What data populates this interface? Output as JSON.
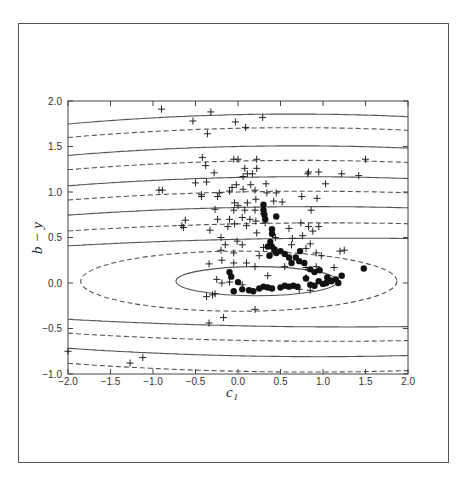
{
  "chart_data": {
    "type": "scatter",
    "title": "",
    "xlabel": "c₁",
    "ylabel": "b − y",
    "xlim": [
      -2.0,
      2.0
    ],
    "ylim": [
      -1.0,
      2.0
    ],
    "xticks": [
      -2.0,
      -1.5,
      -1.0,
      -0.5,
      0.0,
      0.5,
      1.0,
      1.5,
      2.0
    ],
    "xtick_labels": [
      "−2.0",
      "−1.5",
      "−1.0",
      "−0.5",
      "0.0",
      "0.5",
      "1.0",
      "1.5",
      "2.0"
    ],
    "yticks": [
      -1.0,
      -0.5,
      0.0,
      0.5,
      1.0,
      1.5,
      2.0
    ],
    "ytick_labels": [
      "−1.0",
      "−0.5",
      "0.0",
      "0.5",
      "1.0",
      "1.5",
      "2.0"
    ],
    "grid": false,
    "legend": null,
    "contours": {
      "description": "Concentric elliptical contours centered near (0, 0), alternating solid and dashed lines",
      "center": [
        0.0,
        0.0
      ],
      "solid_levels_at_x0": [
        0.17,
        -0.12,
        0.48,
        -0.47,
        0.83,
        -0.8,
        1.16,
        1.5,
        1.85
      ],
      "dashed_levels_at_x0": [
        0.35,
        -0.31,
        0.65,
        -0.63,
        1.0,
        -0.97,
        1.34,
        1.7
      ]
    },
    "series": [
      {
        "name": "plus markers",
        "marker": "+",
        "points": [
          [
            -0.9,
            1.91
          ],
          [
            -0.32,
            1.88
          ],
          [
            -0.53,
            1.78
          ],
          [
            -0.03,
            1.77
          ],
          [
            0.29,
            1.82
          ],
          [
            0.09,
            1.71
          ],
          [
            -0.36,
            1.64
          ],
          [
            -0.42,
            1.38
          ],
          [
            -0.05,
            1.36
          ],
          [
            0.0,
            1.36
          ],
          [
            0.22,
            1.36
          ],
          [
            -0.38,
            1.29
          ],
          [
            0.08,
            1.26
          ],
          [
            -0.28,
            1.21
          ],
          [
            0.22,
            1.26
          ],
          [
            0.17,
            1.2
          ],
          [
            0.11,
            1.2
          ],
          [
            -0.5,
            1.1
          ],
          [
            -0.37,
            1.11
          ],
          [
            0.06,
            1.17
          ],
          [
            0.33,
            1.09
          ],
          [
            -0.02,
            1.08
          ],
          [
            0.15,
            1.08
          ],
          [
            -0.93,
            1.02
          ],
          [
            -0.89,
            1.02
          ],
          [
            -0.43,
            0.95
          ],
          [
            -0.43,
            0.97
          ],
          [
            -0.22,
            0.99
          ],
          [
            -0.24,
            0.95
          ],
          [
            -0.1,
            1.01
          ],
          [
            -0.07,
            1.05
          ],
          [
            0.06,
            1.03
          ],
          [
            0.2,
            1.02
          ],
          [
            0.34,
            0.99
          ],
          [
            0.45,
            0.99
          ],
          [
            0.75,
            0.95
          ],
          [
            0.93,
            0.93
          ],
          [
            -0.04,
            0.88
          ],
          [
            0.11,
            0.88
          ],
          [
            0.21,
            0.92
          ],
          [
            0.42,
            0.9
          ],
          [
            0.52,
            0.89
          ],
          [
            -0.27,
            0.81
          ],
          [
            -0.05,
            0.8
          ],
          [
            0.0,
            0.85
          ],
          [
            0.08,
            0.8
          ],
          [
            0.2,
            0.8
          ],
          [
            0.3,
            0.76
          ],
          [
            0.86,
            0.8
          ],
          [
            -0.62,
            0.69
          ],
          [
            -0.66,
            0.63
          ],
          [
            -0.64,
            0.61
          ],
          [
            -0.24,
            0.7
          ],
          [
            -0.1,
            0.7
          ],
          [
            0.05,
            0.72
          ],
          [
            0.14,
            0.7
          ],
          [
            0.21,
            0.68
          ],
          [
            -0.33,
            0.58
          ],
          [
            -0.12,
            0.62
          ],
          [
            -0.04,
            0.65
          ],
          [
            0.1,
            0.63
          ],
          [
            0.32,
            0.66
          ],
          [
            0.6,
            0.6
          ],
          [
            0.74,
            0.66
          ],
          [
            0.83,
            0.62
          ],
          [
            0.88,
            0.57
          ],
          [
            0.95,
            0.62
          ],
          [
            -0.2,
            0.5
          ],
          [
            -0.01,
            0.46
          ],
          [
            0.22,
            0.55
          ],
          [
            0.44,
            0.5
          ],
          [
            0.64,
            0.49
          ],
          [
            0.76,
            0.52
          ],
          [
            -0.15,
            0.42
          ],
          [
            0.05,
            0.42
          ],
          [
            0.3,
            0.39
          ],
          [
            0.63,
            0.42
          ],
          [
            0.8,
            0.38
          ],
          [
            0.85,
            0.43
          ],
          [
            -0.2,
            0.36
          ],
          [
            -0.05,
            0.33
          ],
          [
            0.25,
            0.3
          ],
          [
            0.4,
            0.33
          ],
          [
            0.92,
            0.33
          ],
          [
            0.98,
            0.3
          ],
          [
            1.2,
            0.35
          ],
          [
            1.25,
            0.36
          ],
          [
            -0.34,
            0.21
          ],
          [
            -0.19,
            0.25
          ],
          [
            -0.05,
            0.22
          ],
          [
            0.1,
            0.22
          ],
          [
            0.2,
            0.18
          ],
          [
            0.55,
            0.18
          ],
          [
            0.8,
            0.17
          ],
          [
            0.92,
            0.18
          ],
          [
            1.13,
            0.17
          ],
          [
            -0.25,
            0.04
          ],
          [
            -0.19,
            0.0
          ],
          [
            -0.1,
            0.01
          ],
          [
            0.05,
            -0.02
          ],
          [
            0.35,
            0.08
          ],
          [
            0.8,
            0.06
          ],
          [
            -0.3,
            -0.13
          ],
          [
            -0.37,
            -0.15
          ],
          [
            -0.27,
            -0.12
          ],
          [
            0.72,
            -0.07
          ],
          [
            0.85,
            -0.08
          ],
          [
            0.2,
            -0.29
          ],
          [
            -0.17,
            -0.38
          ],
          [
            -0.34,
            -0.44
          ],
          [
            -1.27,
            -0.88
          ],
          [
            -1.12,
            -0.82
          ],
          [
            -2.0,
            -0.75
          ],
          [
            1.5,
            1.36
          ],
          [
            0.83,
            1.22
          ],
          [
            0.95,
            1.22
          ],
          [
            1.22,
            1.2
          ],
          [
            1.42,
            1.18
          ],
          [
            1.03,
            1.09
          ],
          [
            0.82,
            1.2
          ]
        ]
      },
      {
        "name": "filled circles",
        "marker": "●",
        "points": [
          [
            0.3,
            0.86
          ],
          [
            0.3,
            0.8
          ],
          [
            0.31,
            0.75
          ],
          [
            0.32,
            0.7
          ],
          [
            0.45,
            0.73
          ],
          [
            0.4,
            0.59
          ],
          [
            0.4,
            0.54
          ],
          [
            0.38,
            0.45
          ],
          [
            0.4,
            0.4
          ],
          [
            0.43,
            0.37
          ],
          [
            0.45,
            0.33
          ],
          [
            0.5,
            0.35
          ],
          [
            0.55,
            0.32
          ],
          [
            0.6,
            0.28
          ],
          [
            0.63,
            0.22
          ],
          [
            0.68,
            0.28
          ],
          [
            0.73,
            0.35
          ],
          [
            0.72,
            0.24
          ],
          [
            0.78,
            0.22
          ],
          [
            0.85,
            0.15
          ],
          [
            0.9,
            0.12
          ],
          [
            0.96,
            0.14
          ],
          [
            1.05,
            0.06
          ],
          [
            1.1,
            0.02
          ],
          [
            1.15,
            0.04
          ],
          [
            1.22,
            0.08
          ],
          [
            1.48,
            0.16
          ],
          [
            0.35,
            0.4
          ],
          [
            0.37,
            0.3
          ],
          [
            -0.1,
            0.12
          ],
          [
            -0.08,
            0.07
          ],
          [
            0.0,
            0.01
          ],
          [
            -0.05,
            -0.09
          ],
          [
            0.05,
            -0.07
          ],
          [
            0.13,
            -0.08
          ],
          [
            0.18,
            -0.09
          ],
          [
            0.25,
            -0.06
          ],
          [
            0.3,
            -0.04
          ],
          [
            0.35,
            -0.05
          ],
          [
            0.4,
            -0.06
          ],
          [
            0.5,
            -0.05
          ],
          [
            0.55,
            -0.03
          ],
          [
            0.6,
            -0.04
          ],
          [
            0.65,
            -0.03
          ],
          [
            0.7,
            -0.04
          ],
          [
            0.85,
            -0.02
          ],
          [
            0.9,
            -0.03
          ],
          [
            1.0,
            -0.01
          ],
          [
            1.04,
            0.0
          ],
          [
            1.08,
            0.03
          ],
          [
            1.18,
            0.0
          ],
          [
            0.95,
            0.02
          ],
          [
            0.8,
            0.05
          ]
        ]
      }
    ]
  },
  "figure": {
    "caption": ""
  }
}
